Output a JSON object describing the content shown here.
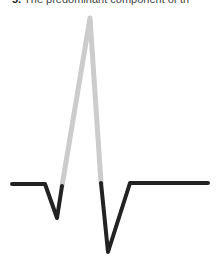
{
  "caption": {
    "number": "5.",
    "text": "The predominant component of th"
  },
  "waveform": {
    "label": "QRS complex",
    "colors": {
      "highlight": "#cccccc",
      "base": "#222222"
    },
    "segments": {
      "baseline_left": [
        [
          12,
          184
        ],
        [
          45,
          184
        ]
      ],
      "q_wave": [
        [
          45,
          184
        ],
        [
          57,
          218
        ],
        [
          62,
          186
        ]
      ],
      "r_wave_highlight": [
        [
          62,
          186
        ],
        [
          90,
          18
        ],
        [
          101,
          183
        ]
      ],
      "s_wave": [
        [
          101,
          183
        ],
        [
          108,
          252
        ],
        [
          130,
          183
        ]
      ],
      "baseline_right": [
        [
          130,
          183
        ],
        [
          208,
          183
        ]
      ]
    }
  }
}
